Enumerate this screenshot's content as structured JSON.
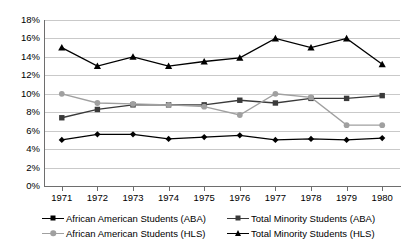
{
  "chart_data": {
    "type": "line",
    "title": "",
    "xlabel": "",
    "ylabel": "",
    "categories": [
      "1971",
      "1972",
      "1973",
      "1974",
      "1975",
      "1976",
      "1977",
      "1978",
      "1979",
      "1980"
    ],
    "ylim": [
      0,
      18
    ],
    "ytick_labels": [
      "0%",
      "2%",
      "4%",
      "6%",
      "8%",
      "10%",
      "12%",
      "14%",
      "16%",
      "18%"
    ],
    "ytick_values": [
      0,
      2,
      4,
      6,
      8,
      10,
      12,
      14,
      16,
      18
    ],
    "grid": true,
    "legend_position": "bottom",
    "series": [
      {
        "name": "African American Students (ABA)",
        "marker": "diamond",
        "color": "#000000",
        "values": [
          5.0,
          5.6,
          5.6,
          5.1,
          5.3,
          5.5,
          5.0,
          5.1,
          5.0,
          5.2
        ]
      },
      {
        "name": "Total Minority Students (ABA)",
        "marker": "square",
        "color": "#3a3a3a",
        "values": [
          7.4,
          8.3,
          8.8,
          8.8,
          8.8,
          9.3,
          9.0,
          9.5,
          9.5,
          9.8
        ]
      },
      {
        "name": "African American Students (HLS)",
        "marker": "circle",
        "color": "#a0a0a0",
        "values": [
          10.0,
          9.0,
          8.9,
          8.8,
          8.6,
          7.7,
          10.0,
          9.6,
          6.6,
          6.6
        ]
      },
      {
        "name": "Total Minority Students (HLS)",
        "marker": "triangle",
        "color": "#000000",
        "values": [
          15.0,
          13.0,
          14.0,
          13.0,
          13.5,
          13.9,
          16.0,
          15.0,
          16.0,
          13.2
        ]
      }
    ]
  },
  "legend": {
    "items": [
      {
        "label": "African American Students (ABA)",
        "marker": "diamond",
        "color": "#000000"
      },
      {
        "label": "Total Minority Students (ABA)",
        "marker": "square",
        "color": "#3a3a3a"
      },
      {
        "label": "African American Students (HLS)",
        "marker": "circle",
        "color": "#a0a0a0"
      },
      {
        "label": "Total Minority Students (HLS)",
        "marker": "triangle",
        "color": "#000000"
      }
    ]
  },
  "colors": {
    "gridline": "#c9c9c9",
    "axis": "#6e6e6e",
    "background": "#ffffff"
  }
}
